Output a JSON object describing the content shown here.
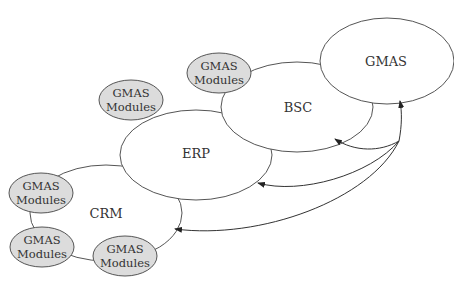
{
  "diagram": {
    "nodes": {
      "gmas": {
        "label": "GMAS"
      },
      "bsc": {
        "label": "BSC"
      },
      "erp": {
        "label": "ERP"
      },
      "crm": {
        "label": "CRM"
      }
    },
    "modules": [
      {
        "line1": "GMAS",
        "line2": "Modules",
        "attached_to": "BSC"
      },
      {
        "line1": "GMAS",
        "line2": "Modules",
        "attached_to": "ERP"
      },
      {
        "line1": "GMAS",
        "line2": "Modules",
        "attached_to": "CRM"
      },
      {
        "line1": "GMAS",
        "line2": "Modules",
        "attached_to": "CRM"
      },
      {
        "line1": "GMAS",
        "line2": "Modules",
        "attached_to": "CRM"
      }
    ],
    "arrows": [
      {
        "from": "hub",
        "to": "GMAS"
      },
      {
        "from": "hub",
        "to": "BSC"
      },
      {
        "from": "hub",
        "to": "ERP"
      },
      {
        "from": "hub",
        "to": "CRM"
      }
    ],
    "colors": {
      "module_fill": "#dcdcdc",
      "stroke": "#555555",
      "text": "#333333"
    }
  }
}
